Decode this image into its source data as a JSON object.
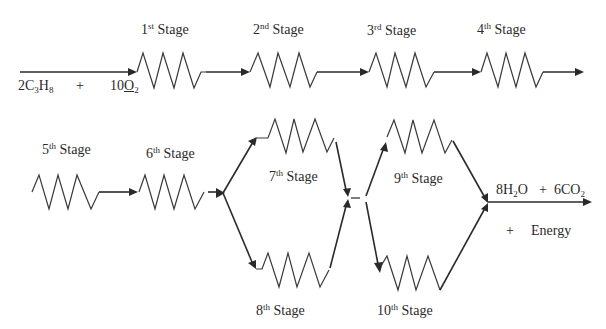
{
  "diagram": {
    "type": "reaction-pathway",
    "reactants": {
      "term1": {
        "coef": "2",
        "a": "C",
        "a_sub": "3",
        "b": "H",
        "b_sub": "8"
      },
      "plus": "+",
      "term2": {
        "coef": "10",
        "a": "O",
        "a_sub": "2"
      }
    },
    "stages": [
      {
        "num": "1",
        "suffix": "st",
        "word": "Stage"
      },
      {
        "num": "2",
        "suffix": "nd",
        "word": "Stage"
      },
      {
        "num": "3",
        "suffix": "rd",
        "word": "Stage"
      },
      {
        "num": "4",
        "suffix": "th",
        "word": "Stage"
      },
      {
        "num": "5",
        "suffix": "th",
        "word": "Stage"
      },
      {
        "num": "6",
        "suffix": "th",
        "word": "Stage"
      },
      {
        "num": "7",
        "suffix": "th",
        "word": "Stage"
      },
      {
        "num": "8",
        "suffix": "th",
        "word": "Stage"
      },
      {
        "num": "9",
        "suffix": "th",
        "word": "Stage"
      },
      {
        "num": "10",
        "suffix": "th",
        "word": "Stage"
      }
    ],
    "products": {
      "term1": {
        "coef": "8",
        "a": "H",
        "a_sub": "2",
        "b": "O"
      },
      "plus": "+",
      "term2": {
        "coef": "6",
        "a": "CO",
        "a_sub": "2"
      },
      "plus2": "+",
      "energy": "Energy"
    },
    "colors": {
      "line": "#2a2a2a",
      "background": "#ffffff"
    }
  }
}
